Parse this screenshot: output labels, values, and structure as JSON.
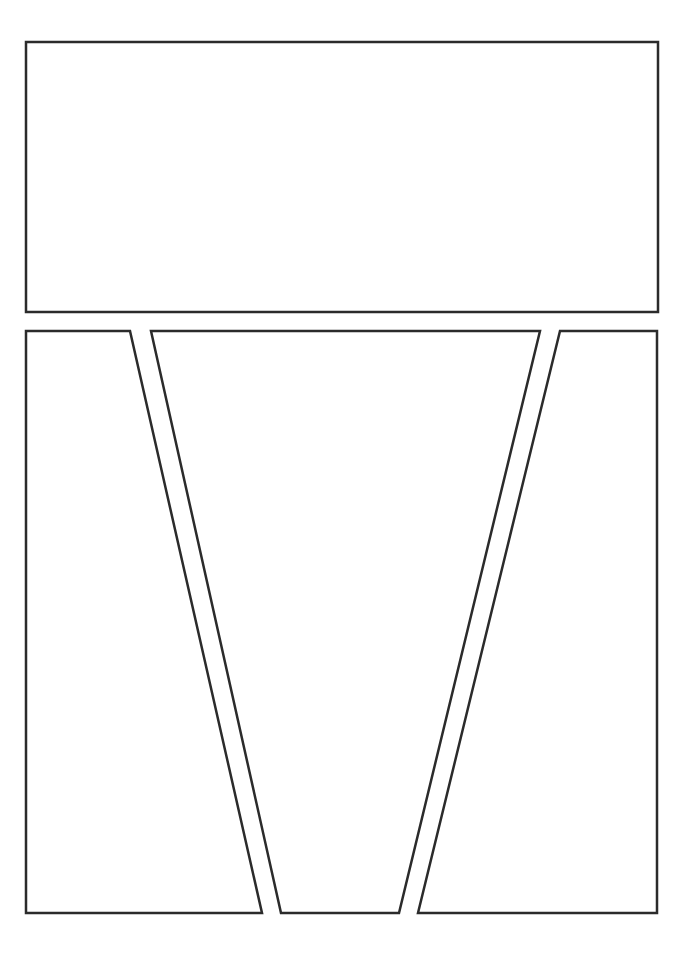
{
  "page": {
    "type": "comic-panel-layout-template",
    "background": "#ffffff",
    "stroke_color": "#2b2b2b",
    "stroke_width": 2.5
  },
  "panels": [
    {
      "name": "panel-top",
      "points": "26,42 658,42 658,312 26,312"
    },
    {
      "name": "panel-bottom-left",
      "points": "26,331 130,331 262,913 26,913"
    },
    {
      "name": "panel-bottom-middle",
      "points": "151,331 540,331 399,913 281,913"
    },
    {
      "name": "panel-bottom-right",
      "points": "560,331 657,331 657,913 418,913"
    }
  ]
}
